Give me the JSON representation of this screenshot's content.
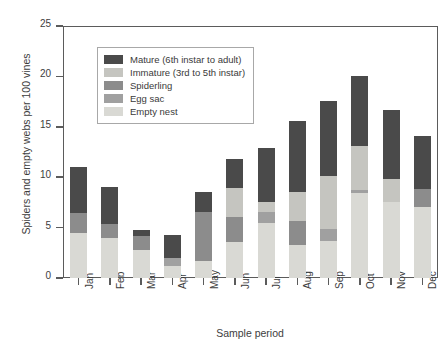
{
  "chart_data": {
    "type": "bar",
    "subtype": "stacked-vertical",
    "title": "",
    "xlabel": "Sample period",
    "ylabel": "Spiders and empty webs per 100 vines",
    "ylim": [
      0,
      25
    ],
    "yticks": [
      0,
      5,
      10,
      15,
      20,
      25
    ],
    "grid": false,
    "legend_position": "upper-left-inside",
    "categories": [
      "Jan",
      "Feb",
      "Mar",
      "Apr",
      "May",
      "Jun",
      "Jul",
      "Aug",
      "Sep",
      "Oct",
      "Nov",
      "Dec"
    ],
    "series": [
      {
        "name": "Empty nest",
        "color": "#d9d9d4",
        "values": [
          4.5,
          4.0,
          2.8,
          1.2,
          1.7,
          3.6,
          5.5,
          3.3,
          3.7,
          8.4,
          7.5,
          7.0
        ]
      },
      {
        "name": "Egg sac",
        "color": "#a0a0a0",
        "values": [
          0.0,
          0.0,
          0.0,
          0.8,
          0.0,
          0.0,
          1.0,
          0.0,
          1.2,
          0.3,
          0.0,
          0.0
        ]
      },
      {
        "name": "Spiderling",
        "color": "#8c8c8c",
        "values": [
          1.9,
          1.4,
          1.4,
          0.0,
          4.8,
          2.5,
          0.0,
          2.4,
          0.0,
          0.0,
          0.0,
          1.8
        ]
      },
      {
        "name": "Immature (3rd to 5th instar)",
        "color": "#c5c5c0",
        "values": [
          0.0,
          0.0,
          0.0,
          0.0,
          0.0,
          2.8,
          1.0,
          2.8,
          5.2,
          4.4,
          2.3,
          0.0
        ]
      },
      {
        "name": "Mature (6th instar to adult)",
        "color": "#4a4a4a",
        "values": [
          4.6,
          3.6,
          0.6,
          2.3,
          2.0,
          2.9,
          5.4,
          7.1,
          7.5,
          6.9,
          6.9,
          5.3
        ]
      }
    ],
    "totals": [
      11.0,
      9.0,
      4.8,
      4.3,
      8.5,
      11.8,
      12.9,
      15.6,
      17.6,
      20.0,
      16.7,
      14.1
    ],
    "legend_order": [
      "Mature (6th instar to adult)",
      "Immature (3rd to 5th instar)",
      "Spiderling",
      "Egg sac",
      "Empty nest"
    ]
  }
}
